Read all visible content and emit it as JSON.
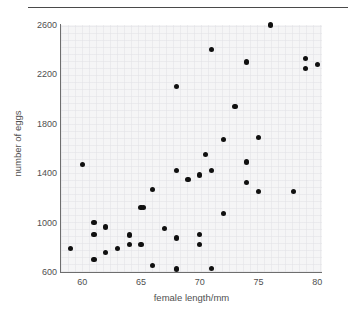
{
  "chart_data": {
    "type": "scatter",
    "title": "",
    "xlabel": "female length/mm",
    "ylabel": "number of eggs",
    "xlim": [
      58.2,
      80.4
    ],
    "ylim": [
      600,
      2600
    ],
    "xticks": [
      60,
      65,
      70,
      75,
      80
    ],
    "yticks": [
      600,
      1000,
      1400,
      1800,
      2200,
      2600
    ],
    "grid": true,
    "legend": null,
    "marker_color": "#101010",
    "plot_background": "#f5f5f6",
    "points": [
      {
        "x": 59.0,
        "y": 790
      },
      {
        "x": 60.0,
        "y": 1470
      },
      {
        "x": 61.0,
        "y": 1000
      },
      {
        "x": 61.0,
        "y": 905
      },
      {
        "x": 61.0,
        "y": 700
      },
      {
        "x": 62.0,
        "y": 965
      },
      {
        "x": 62.0,
        "y": 755
      },
      {
        "x": 63.0,
        "y": 790
      },
      {
        "x": 64.0,
        "y": 900
      },
      {
        "x": 64.0,
        "y": 820
      },
      {
        "x": 65.0,
        "y": 1120
      },
      {
        "x": 65.0,
        "y": 820
      },
      {
        "x": 65.2,
        "y": 1120
      },
      {
        "x": 66.0,
        "y": 1270
      },
      {
        "x": 66.0,
        "y": 650
      },
      {
        "x": 67.0,
        "y": 950
      },
      {
        "x": 68.0,
        "y": 2100
      },
      {
        "x": 68.0,
        "y": 1420
      },
      {
        "x": 68.0,
        "y": 875
      },
      {
        "x": 68.0,
        "y": 625
      },
      {
        "x": 69.0,
        "y": 1350
      },
      {
        "x": 70.0,
        "y": 1385
      },
      {
        "x": 70.0,
        "y": 905
      },
      {
        "x": 70.0,
        "y": 820
      },
      {
        "x": 70.5,
        "y": 1550
      },
      {
        "x": 71.0,
        "y": 2400
      },
      {
        "x": 71.0,
        "y": 1420
      },
      {
        "x": 71.0,
        "y": 630
      },
      {
        "x": 72.0,
        "y": 1670
      },
      {
        "x": 72.0,
        "y": 1075
      },
      {
        "x": 73.0,
        "y": 1940
      },
      {
        "x": 74.0,
        "y": 2300
      },
      {
        "x": 74.0,
        "y": 1490
      },
      {
        "x": 74.0,
        "y": 1325
      },
      {
        "x": 75.0,
        "y": 1690
      },
      {
        "x": 75.0,
        "y": 1250
      },
      {
        "x": 76.0,
        "y": 2600
      },
      {
        "x": 78.0,
        "y": 1255
      },
      {
        "x": 79.0,
        "y": 2330
      },
      {
        "x": 79.0,
        "y": 2250
      },
      {
        "x": 80.0,
        "y": 2280
      }
    ]
  }
}
